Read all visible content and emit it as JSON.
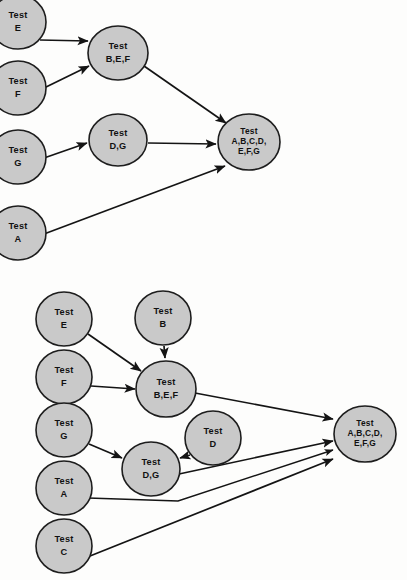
{
  "figure": {
    "type": "diagram",
    "subtype": "directed-acyclic-graph",
    "background_color": "#fdfdfc",
    "node_fill_color": "#c9c9c9",
    "node_stroke_color": "#1d1d1d",
    "edge_color": "#141414",
    "label_prefix": "Test"
  },
  "diagrams": [
    {
      "id": "top-diagram",
      "name": "top-integration-test-graph",
      "nodes": [
        {
          "id": "t_E",
          "name": "node-test-e",
          "lines": [
            "Test",
            "E"
          ],
          "cx": 18,
          "cy": 22,
          "rx": 28,
          "ry": 27,
          "clipped": true
        },
        {
          "id": "t_F",
          "name": "node-test-f",
          "lines": [
            "Test",
            "F"
          ],
          "cx": 18,
          "cy": 88,
          "rx": 28,
          "ry": 27,
          "clipped": true
        },
        {
          "id": "t_G",
          "name": "node-test-g",
          "lines": [
            "Test",
            "G"
          ],
          "cx": 18,
          "cy": 157,
          "rx": 28,
          "ry": 27,
          "clipped": true
        },
        {
          "id": "t_A",
          "name": "node-test-a",
          "lines": [
            "Test",
            "A"
          ],
          "cx": 18,
          "cy": 233,
          "rx": 28,
          "ry": 27,
          "clipped": true
        },
        {
          "id": "t_BEF",
          "name": "node-test-bef",
          "lines": [
            "Test",
            "B,E,F"
          ],
          "cx": 118,
          "cy": 53,
          "rx": 30,
          "ry": 27,
          "clipped": false
        },
        {
          "id": "t_DG",
          "name": "node-test-dg",
          "lines": [
            "Test",
            "D,G"
          ],
          "cx": 118,
          "cy": 140,
          "rx": 29,
          "ry": 26,
          "clipped": false
        },
        {
          "id": "t_ALL",
          "name": "node-test-all",
          "lines": [
            "Test",
            "A,B,C,D,",
            "E,F,G"
          ],
          "cx": 249,
          "cy": 142,
          "rx": 31,
          "ry": 28,
          "clipped": false
        }
      ],
      "edges": [
        {
          "name": "edge-e-to-bef",
          "from": "t_E",
          "to": "t_BEF",
          "x1": 40,
          "y1": 40,
          "x2": 88,
          "y2": 41
        },
        {
          "name": "edge-f-to-bef",
          "from": "t_F",
          "to": "t_BEF",
          "x1": 44,
          "y1": 88,
          "x2": 89,
          "y2": 66
        },
        {
          "name": "edge-g-to-dg",
          "from": "t_G",
          "to": "t_DG",
          "x1": 44,
          "y1": 158,
          "x2": 87,
          "y2": 143
        },
        {
          "name": "edge-bef-to-all",
          "from": "t_BEF",
          "to": "t_ALL",
          "x1": 144,
          "y1": 66,
          "x2": 226,
          "y2": 123
        },
        {
          "name": "edge-dg-to-all",
          "from": "t_DG",
          "to": "t_ALL",
          "x1": 148,
          "y1": 143,
          "x2": 216,
          "y2": 144
        },
        {
          "name": "edge-a-to-all",
          "from": "t_A",
          "to": "t_ALL",
          "x1": 44,
          "y1": 234,
          "x2": 225,
          "y2": 166
        }
      ]
    },
    {
      "id": "bottom-diagram",
      "name": "bottom-integration-test-graph",
      "nodes": [
        {
          "id": "b_E",
          "name": "node-test-e",
          "lines": [
            "Test",
            "E"
          ],
          "cx": 64,
          "cy": 319,
          "rx": 28,
          "ry": 27,
          "clipped": false
        },
        {
          "id": "b_B",
          "name": "node-test-b",
          "lines": [
            "Test",
            "B"
          ],
          "cx": 163,
          "cy": 318,
          "rx": 28,
          "ry": 27,
          "clipped": false
        },
        {
          "id": "b_F",
          "name": "node-test-f",
          "lines": [
            "Test",
            "F"
          ],
          "cx": 64,
          "cy": 377,
          "rx": 28,
          "ry": 27,
          "clipped": false
        },
        {
          "id": "b_BEF",
          "name": "node-test-bef",
          "lines": [
            "Test",
            "B,E,F"
          ],
          "cx": 166,
          "cy": 389,
          "rx": 30,
          "ry": 28,
          "clipped": false
        },
        {
          "id": "b_G",
          "name": "node-test-g",
          "lines": [
            "Test",
            "G"
          ],
          "cx": 64,
          "cy": 430,
          "rx": 28,
          "ry": 27,
          "clipped": false
        },
        {
          "id": "b_D",
          "name": "node-test-d",
          "lines": [
            "Test",
            "D"
          ],
          "cx": 213,
          "cy": 438,
          "rx": 28,
          "ry": 27,
          "clipped": false
        },
        {
          "id": "b_DG",
          "name": "node-test-dg",
          "lines": [
            "Test",
            "D,G"
          ],
          "cx": 151,
          "cy": 469,
          "rx": 29,
          "ry": 27,
          "clipped": false
        },
        {
          "id": "b_A",
          "name": "node-test-a",
          "lines": [
            "Test",
            "A"
          ],
          "cx": 64,
          "cy": 488,
          "rx": 28,
          "ry": 27,
          "clipped": false
        },
        {
          "id": "b_C",
          "name": "node-test-c",
          "lines": [
            "Test",
            "C"
          ],
          "cx": 64,
          "cy": 546,
          "rx": 28,
          "ry": 27,
          "clipped": false
        },
        {
          "id": "b_ALL",
          "name": "node-test-all",
          "lines": [
            "Test",
            "A,B,C,D,",
            "E,F,G"
          ],
          "cx": 365,
          "cy": 434,
          "rx": 31,
          "ry": 28,
          "clipped": false
        }
      ],
      "edges": [
        {
          "name": "edge-e-to-bef",
          "from": "b_E",
          "to": "b_BEF",
          "kind": "line",
          "x1": 88,
          "y1": 334,
          "x2": 141,
          "y2": 371
        },
        {
          "name": "edge-b-to-bef",
          "from": "b_B",
          "to": "b_BEF",
          "kind": "line",
          "x1": 164,
          "y1": 346,
          "x2": 165,
          "y2": 358
        },
        {
          "name": "edge-f-to-bef",
          "from": "b_F",
          "to": "b_BEF",
          "kind": "line",
          "x1": 91,
          "y1": 386,
          "x2": 135,
          "y2": 389
        },
        {
          "name": "edge-g-to-dg",
          "from": "b_G",
          "to": "b_DG",
          "kind": "line",
          "x1": 89,
          "y1": 444,
          "x2": 122,
          "y2": 458
        },
        {
          "name": "edge-d-to-dg",
          "from": "b_D",
          "to": "b_DG",
          "kind": "line",
          "x1": 190,
          "y1": 455,
          "x2": 180,
          "y2": 458
        },
        {
          "name": "edge-bef-to-all",
          "from": "b_BEF",
          "to": "b_ALL",
          "kind": "line",
          "x1": 195,
          "y1": 393,
          "x2": 333,
          "y2": 419
        },
        {
          "name": "edge-dg-to-all",
          "from": "b_DG",
          "to": "b_ALL",
          "kind": "line",
          "x1": 179,
          "y1": 474,
          "x2": 333,
          "y2": 441
        },
        {
          "name": "edge-a-to-all",
          "from": "b_A",
          "to": "b_ALL",
          "kind": "poly",
          "points": "88,498 178,501 333,450"
        },
        {
          "name": "edge-c-to-all",
          "from": "b_C",
          "to": "b_ALL",
          "kind": "line",
          "x1": 90,
          "y1": 556,
          "x2": 333,
          "y2": 459
        }
      ]
    }
  ]
}
